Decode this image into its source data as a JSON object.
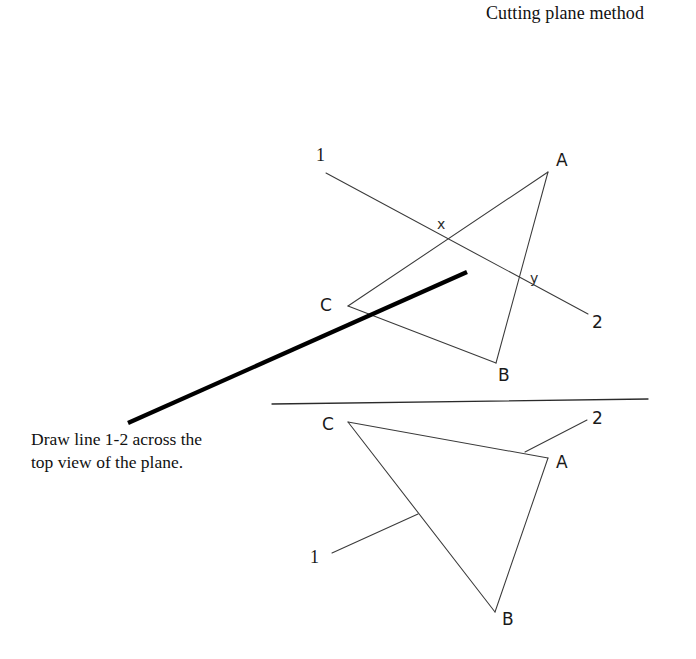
{
  "page": {
    "width": 696,
    "height": 659,
    "background": "#ffffff",
    "ink_color": "#1a1a1a"
  },
  "title": {
    "text": "Cutting plane method"
  },
  "caption": {
    "line1": "Draw line 1-2 across the",
    "line2": "top view of the plane."
  },
  "chart_data": {
    "type": "diagram",
    "title": "Cutting plane method",
    "views": [
      {
        "name": "front-view",
        "label": "upper view",
        "triangle": {
          "vertices": [
            {
              "label": "A",
              "x": 548,
              "y": 172
            },
            {
              "label": "B",
              "x": 496,
              "y": 363
            },
            {
              "label": "C",
              "x": 348,
              "y": 306
            }
          ],
          "label_positions": [
            {
              "label": "A",
              "x": 556,
              "y": 166
            },
            {
              "label": "B",
              "x": 498,
              "y": 381
            },
            {
              "label": "C",
              "x": 320,
              "y": 311
            }
          ]
        },
        "cutting_line": {
          "label_start": "1",
          "label_end": "2",
          "start": {
            "x": 326,
            "y": 173
          },
          "end": {
            "x": 588,
            "y": 314
          },
          "label_start_pos": {
            "x": 316,
            "y": 161
          },
          "label_end_pos": {
            "x": 592,
            "y": 328
          }
        },
        "intersections": [
          {
            "label": "x",
            "x": 444,
            "y": 243,
            "label_pos": {
              "x": 437,
              "y": 229
            }
          },
          {
            "label": "y",
            "x": 518,
            "y": 284,
            "label_pos": {
              "x": 530,
              "y": 283
            }
          }
        ]
      },
      {
        "name": "top-view",
        "label": "lower view",
        "triangle": {
          "vertices": [
            {
              "label": "C",
              "x": 348,
              "y": 422
            },
            {
              "label": "A",
              "x": 548,
              "y": 458
            },
            {
              "label": "B",
              "x": 495,
              "y": 612
            }
          ],
          "label_positions": [
            {
              "label": "C",
              "x": 322,
              "y": 430
            },
            {
              "label": "A",
              "x": 556,
              "y": 468
            },
            {
              "label": "B",
              "x": 502,
              "y": 625
            }
          ]
        },
        "leaders": [
          {
            "label": "1",
            "from": {
              "x": 332,
              "y": 553
            },
            "to": {
              "x": 418,
              "y": 514
            },
            "label_pos": {
              "x": 310,
              "y": 563
            }
          },
          {
            "label": "2",
            "from": {
              "x": 587,
              "y": 420
            },
            "to": {
              "x": 525,
              "y": 452
            },
            "label_pos": {
              "x": 592,
              "y": 424
            }
          }
        ]
      }
    ],
    "fold_line": {
      "name": "fold-line",
      "x1": 272,
      "y1": 404,
      "x2": 648,
      "y2": 399
    },
    "caption_leader": {
      "name": "caption-leader-line",
      "x1": 128,
      "y1": 423,
      "x2": 467,
      "y2": 272,
      "weight": "bold"
    }
  }
}
